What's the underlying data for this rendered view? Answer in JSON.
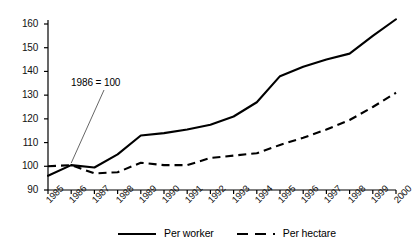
{
  "chart_data": {
    "type": "line",
    "title": "",
    "subtitle": "",
    "xlabel": "",
    "ylabel": "",
    "annotation": "1986 = 100",
    "grid": false,
    "legend_position": "bottom",
    "xlim": [
      1985,
      2000
    ],
    "ylim": [
      90,
      165
    ],
    "yticks": [
      90,
      100,
      110,
      120,
      130,
      140,
      150,
      160
    ],
    "categories": [
      "1985",
      "1986",
      "1987",
      "1988",
      "1989",
      "1990",
      "1991",
      "1992",
      "1993",
      "1994",
      "1995",
      "1996",
      "1997",
      "1998",
      "1999",
      "2000"
    ],
    "series": [
      {
        "name": "Per worker",
        "style": "solid",
        "color": "#000000",
        "values": [
          96,
          100.5,
          99.5,
          105,
          113,
          114,
          115.5,
          117.5,
          121,
          127,
          138,
          142,
          145,
          147.5,
          155,
          162
        ]
      },
      {
        "name": "Per hectare",
        "style": "dashed",
        "color": "#000000",
        "values": [
          100,
          100.5,
          97,
          97.5,
          101.5,
          100.5,
          100.5,
          103.5,
          104.5,
          105.5,
          109,
          112,
          115.5,
          119.5,
          125,
          131
        ]
      }
    ]
  },
  "axis": {
    "ytick_labels": [
      "160",
      "150",
      "140",
      "130",
      "120",
      "110",
      "100",
      "90"
    ],
    "xtick_labels": [
      "1985",
      "1986",
      "1987",
      "1988",
      "1989",
      "1990",
      "1991",
      "1992",
      "1993",
      "1994",
      "1995",
      "1996",
      "1997",
      "1998",
      "1999",
      "2000"
    ]
  },
  "legend": {
    "items": [
      {
        "label": "Per worker",
        "style": "solid"
      },
      {
        "label": "Per hectare",
        "style": "dashed"
      }
    ]
  },
  "annotation": {
    "text": "1986 = 100"
  },
  "colors": {
    "line": "#000000",
    "axis": "#000000",
    "leader": "#555555",
    "background": "#ffffff"
  }
}
